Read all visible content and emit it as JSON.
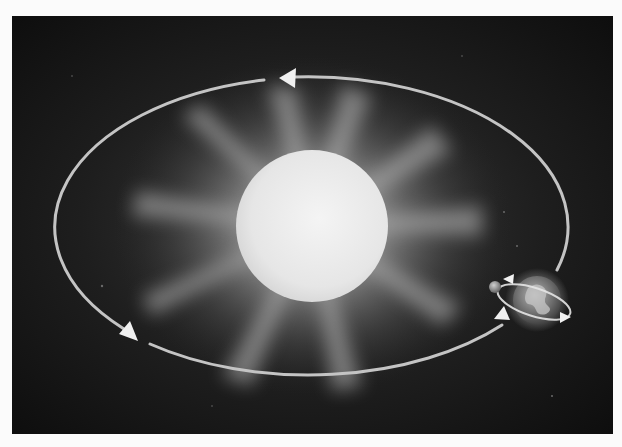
{
  "diagram": {
    "title": "Earth orbiting the Sun",
    "colors": {
      "page_background": "#fbfbfb",
      "space_background": "#151515",
      "sun_disk": "#ececec",
      "sun_glow": "#bdbdbd",
      "orbit_line": "#c8c8c8",
      "arrow_fill": "#f0f0f0",
      "earth": "#8a8a8a",
      "moon": "#9a9a9a"
    },
    "elements": {
      "sun": {
        "label": "Sun",
        "cx": 300,
        "cy": 210,
        "r": 76
      },
      "orbit": {
        "label": "Orbit",
        "cx": 300,
        "cy": 210,
        "rx": 260,
        "ry": 150,
        "direction": "counter-clockwise"
      },
      "earth": {
        "label": "Earth",
        "cx": 525,
        "cy": 284,
        "r": 24
      },
      "moon": {
        "label": "Moon",
        "cx": 483,
        "cy": 271,
        "r": 6
      },
      "orbit_arrows": [
        {
          "name": "top-arrow",
          "x": 268,
          "y": 62,
          "direction": "left"
        },
        {
          "name": "lower-left-arrow",
          "x": 126,
          "y": 325,
          "direction": "down-right"
        },
        {
          "name": "lower-right-arrow",
          "x": 498,
          "y": 304,
          "direction": "up-right"
        }
      ],
      "rotation_arrows": [
        {
          "name": "rotation-arrow-left",
          "direction": "left"
        },
        {
          "name": "rotation-arrow-right",
          "direction": "right"
        }
      ]
    }
  }
}
